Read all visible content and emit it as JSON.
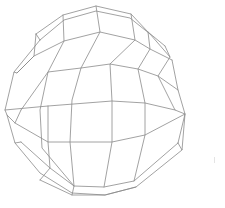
{
  "figure": {
    "width": 225,
    "height": 208,
    "background": "#ffffff",
    "stroke_color": "#8a8a8a",
    "stroke_width": 0.8,
    "speck_color": "#e4e4e4",
    "speck": [
      214,
      157
    ]
  },
  "mesh": {
    "latitude_lines": [
      [
        [
          36,
          34
        ],
        [
          63,
          15
        ],
        [
          96,
          6
        ],
        [
          131,
          14
        ],
        [
          148,
          32
        ],
        [
          165,
          46
        ]
      ],
      [
        [
          40,
          40
        ],
        [
          64,
          20
        ],
        [
          96,
          11
        ],
        [
          130,
          18
        ],
        [
          150,
          34
        ],
        [
          170,
          57
        ]
      ],
      [
        [
          14,
          72
        ],
        [
          40,
          40
        ]
      ],
      [
        [
          17,
          73
        ],
        [
          34,
          56
        ],
        [
          64,
          41
        ],
        [
          100,
          32
        ],
        [
          135,
          40
        ],
        [
          150,
          49
        ],
        [
          172,
          60
        ]
      ],
      [
        [
          21,
          110
        ],
        [
          48,
          72
        ],
        [
          81,
          68
        ],
        [
          110,
          64
        ],
        [
          138,
          69
        ],
        [
          158,
          76
        ],
        [
          178,
          90
        ]
      ],
      [
        [
          5,
          110
        ],
        [
          48,
          106
        ],
        [
          112,
          101
        ],
        [
          145,
          103
        ],
        [
          175,
          110
        ]
      ],
      [
        [
          7,
          115
        ],
        [
          15,
          123
        ],
        [
          48,
          142
        ],
        [
          112,
          142
        ],
        [
          145,
          135
        ],
        [
          185,
          114
        ]
      ],
      [
        [
          15,
          143
        ],
        [
          40,
          173
        ],
        [
          72,
          193
        ],
        [
          105,
          195
        ],
        [
          136,
          187
        ],
        [
          182,
          150
        ]
      ],
      [
        [
          21,
          142
        ],
        [
          50,
          168
        ],
        [
          74,
          186
        ],
        [
          104,
          187
        ],
        [
          134,
          181
        ],
        [
          178,
          143
        ]
      ],
      [
        [
          40,
          180
        ],
        [
          72,
          195
        ],
        [
          105,
          195
        ],
        [
          136,
          187
        ]
      ]
    ],
    "longitude_lines": [
      [
        [
          63,
          15
        ],
        [
          64,
          41
        ],
        [
          48,
          72
        ],
        [
          40,
          110
        ],
        [
          42,
          148
        ],
        [
          74,
          186
        ],
        [
          72,
          195
        ]
      ],
      [
        [
          96,
          6
        ],
        [
          100,
          32
        ],
        [
          81,
          68
        ],
        [
          72,
          100
        ],
        [
          70,
          142
        ],
        [
          74,
          186
        ]
      ],
      [
        [
          131,
          14
        ],
        [
          135,
          40
        ],
        [
          110,
          64
        ],
        [
          112,
          101
        ],
        [
          112,
          142
        ],
        [
          104,
          187
        ]
      ],
      [
        [
          148,
          32
        ],
        [
          150,
          49
        ],
        [
          138,
          69
        ],
        [
          145,
          103
        ],
        [
          145,
          135
        ],
        [
          134,
          181
        ]
      ],
      [
        [
          165,
          46
        ],
        [
          170,
          57
        ],
        [
          158,
          76
        ],
        [
          175,
          110
        ],
        [
          185,
          114
        ],
        [
          178,
          143
        ]
      ],
      [
        [
          36,
          34
        ],
        [
          34,
          56
        ],
        [
          17,
          73
        ],
        [
          14,
          72
        ],
        [
          5,
          110
        ],
        [
          7,
          115
        ],
        [
          15,
          143
        ],
        [
          21,
          142
        ]
      ],
      [
        [
          40,
          40
        ],
        [
          36,
          34
        ]
      ],
      [
        [
          172,
          60
        ],
        [
          178,
          90
        ],
        [
          185,
          114
        ],
        [
          182,
          150
        ],
        [
          178,
          143
        ]
      ],
      [
        [
          48,
          106
        ],
        [
          48,
          142
        ],
        [
          50,
          168
        ],
        [
          40,
          180
        ]
      ],
      [
        [
          21,
          110
        ],
        [
          15,
          123
        ]
      ]
    ]
  }
}
